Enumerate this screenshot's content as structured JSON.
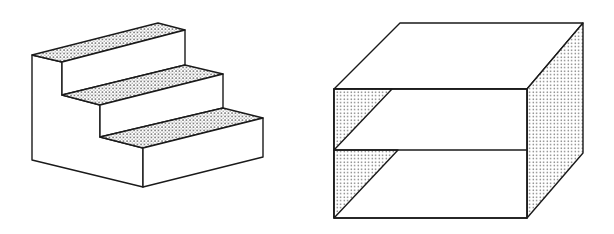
{
  "figure": {
    "colors": {
      "stroke": "#1a1a1a",
      "fill": "#ffffff",
      "dot": "#555555"
    },
    "staircase": {
      "steps": 3,
      "treads_shaded": true
    },
    "shelf_box": {
      "shelves": 2,
      "side_faces_shaded": true
    }
  }
}
